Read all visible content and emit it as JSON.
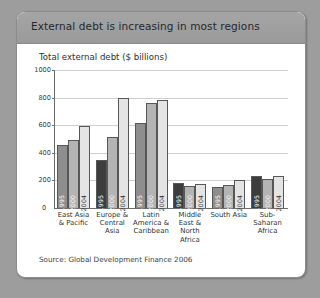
{
  "card": {
    "header_title": "External debt is increasing in most regions",
    "subtitle": "Total external debt ($ billions)",
    "source": "Source: Global Development Finance 2006"
  },
  "chart_data": {
    "type": "bar",
    "title": "External debt is increasing in most regions",
    "subtitle": "Total external debt ($ billions)",
    "xlabel": "",
    "ylabel": "Total external debt ($ billions)",
    "ylim": [
      0,
      1000
    ],
    "ytick_labels": [
      "1000",
      "800",
      "600",
      "400",
      "200",
      "0"
    ],
    "yticks": [
      1000,
      800,
      600,
      400,
      200,
      0
    ],
    "grid": true,
    "legend": "none",
    "series_labels_inside_bars": true,
    "categories": [
      "East Asia & Pacific",
      "Europe & Central Asia",
      "Latin America & Caribbean",
      "Middle East & North Africa",
      "South Asia",
      "Sub-Saharan Africa"
    ],
    "series": [
      {
        "name": "1995",
        "values": [
          455,
          350,
          615,
          180,
          155,
          235
        ]
      },
      {
        "name": "2000",
        "values": [
          495,
          512,
          760,
          160,
          165,
          210
        ]
      },
      {
        "name": "2004",
        "values": [
          595,
          795,
          780,
          172,
          200,
          230
        ]
      }
    ],
    "bar_colors": {
      "1995": "#8e8e8e",
      "2000": "#b4b4b4",
      "2004": "#e4e4e4",
      "1995_dark_groups": "#3d3d3d"
    },
    "dark_1995_categories": [
      "Europe & Central Asia",
      "Middle East & North Africa",
      "Sub-Saharan Africa"
    ],
    "annotation": "Source: Global Development Finance 2006"
  },
  "colors": {
    "page_background": "#9d9d9d",
    "card_background": "#ffffff",
    "header_background": "#9f9f9f",
    "axis": "#6d6d6d",
    "gridline": "#cfcfcf"
  }
}
